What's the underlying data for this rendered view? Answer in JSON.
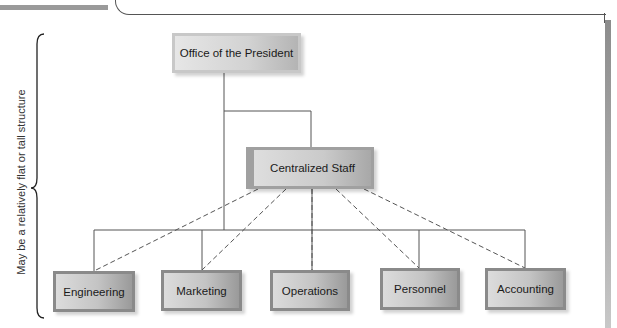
{
  "diagram": {
    "type": "org_chart",
    "side_label": "May be a relatively flat or tall structure",
    "top": {
      "label": "Office of the President"
    },
    "staff": {
      "label": "Centralized Staff",
      "relation": "dashed advisory lines to each department"
    },
    "departments": [
      {
        "label": "Engineering"
      },
      {
        "label": "Marketing"
      },
      {
        "label": "Operations"
      },
      {
        "label": "Personnel"
      },
      {
        "label": "Accounting"
      }
    ],
    "colors": {
      "line": "#555555",
      "box_border": "#8a8a8a",
      "box_fill_light": "#dcdcdc",
      "box_fill_dark": "#9a9a9a"
    }
  }
}
